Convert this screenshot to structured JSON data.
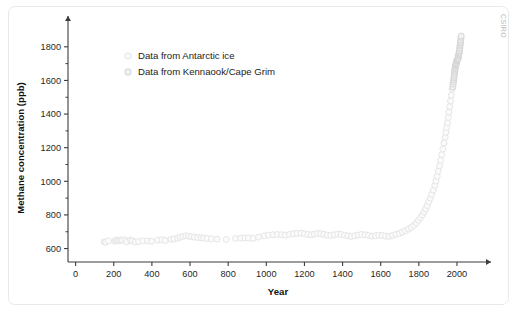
{
  "figure": {
    "credit": "CSIRO",
    "background_color": "#ffffff",
    "border_color": "#e9e9e9"
  },
  "legend": {
    "position": "upper-left-inside",
    "entries": [
      {
        "label": "Data from Antarctic ice",
        "marker": "open-circle-light",
        "color": "#fbfbfb",
        "edge_color": "#e2e2e2"
      },
      {
        "label": "Data from Kennaook/Cape Grim",
        "marker": "open-circle-gray",
        "color": "#f2f2f2",
        "edge_color": "#d2d2d2"
      }
    ]
  },
  "chart_data": {
    "type": "scatter",
    "title": "",
    "xlabel": "Year",
    "ylabel": "Methane concentration (ppb)",
    "xlim": [
      -40,
      2105
    ],
    "ylim": [
      520,
      1900
    ],
    "xticks": [
      0,
      200,
      400,
      600,
      800,
      1000,
      1200,
      1400,
      1600,
      1800,
      2000
    ],
    "yticks": [
      600,
      800,
      1000,
      1200,
      1400,
      1600,
      1800
    ],
    "xtick_labels": [
      "0",
      "200",
      "400",
      "600",
      "800",
      "1000",
      "1200",
      "1400",
      "1600",
      "1800",
      "2000"
    ],
    "ytick_labels": [
      "600",
      "800",
      "1000",
      "1200",
      "1400",
      "1600",
      "1800"
    ],
    "y_minor_ticks": [
      700,
      900,
      1100,
      1300,
      1500,
      1700
    ],
    "grid": false,
    "axis_style": "arrow-ended-open-axes",
    "series": [
      {
        "name": "Data from Antarctic ice",
        "marker_class": "pt-ice",
        "points": [
          [
            150,
            640
          ],
          [
            158,
            638
          ],
          [
            172,
            646
          ],
          [
            205,
            644
          ],
          [
            212,
            650
          ],
          [
            220,
            648
          ],
          [
            228,
            646
          ],
          [
            236,
            651
          ],
          [
            244,
            649
          ],
          [
            258,
            652
          ],
          [
            268,
            641
          ],
          [
            288,
            650
          ],
          [
            296,
            646
          ],
          [
            312,
            639
          ],
          [
            330,
            642
          ],
          [
            352,
            646
          ],
          [
            378,
            645
          ],
          [
            398,
            643
          ],
          [
            430,
            650
          ],
          [
            452,
            652
          ],
          [
            470,
            648
          ],
          [
            500,
            655
          ],
          [
            516,
            658
          ],
          [
            535,
            662
          ],
          [
            548,
            668
          ],
          [
            562,
            672
          ],
          [
            578,
            676
          ],
          [
            592,
            674
          ],
          [
            606,
            670
          ],
          [
            622,
            668
          ],
          [
            640,
            666
          ],
          [
            658,
            664
          ],
          [
            672,
            662
          ],
          [
            690,
            660
          ],
          [
            712,
            658
          ],
          [
            742,
            656
          ],
          [
            790,
            654
          ],
          [
            838,
            660
          ],
          [
            866,
            662
          ],
          [
            888,
            664
          ],
          [
            906,
            663
          ],
          [
            930,
            661
          ],
          [
            960,
            668
          ],
          [
            990,
            676
          ],
          [
            1012,
            680
          ],
          [
            1036,
            682
          ],
          [
            1058,
            684
          ],
          [
            1080,
            682
          ],
          [
            1100,
            680
          ],
          [
            1122,
            684
          ],
          [
            1142,
            688
          ],
          [
            1162,
            690
          ],
          [
            1182,
            692
          ],
          [
            1200,
            688
          ],
          [
            1218,
            684
          ],
          [
            1236,
            682
          ],
          [
            1252,
            686
          ],
          [
            1268,
            690
          ],
          [
            1286,
            688
          ],
          [
            1302,
            684
          ],
          [
            1320,
            680
          ],
          [
            1338,
            678
          ],
          [
            1356,
            682
          ],
          [
            1374,
            686
          ],
          [
            1392,
            684
          ],
          [
            1410,
            680
          ],
          [
            1428,
            676
          ],
          [
            1446,
            672
          ],
          [
            1464,
            676
          ],
          [
            1482,
            680
          ],
          [
            1500,
            684
          ],
          [
            1518,
            682
          ],
          [
            1536,
            678
          ],
          [
            1554,
            674
          ],
          [
            1572,
            676
          ],
          [
            1590,
            680
          ],
          [
            1608,
            678
          ],
          [
            1626,
            674
          ],
          [
            1644,
            672
          ],
          [
            1662,
            678
          ],
          [
            1680,
            684
          ],
          [
            1698,
            690
          ],
          [
            1714,
            698
          ],
          [
            1730,
            706
          ],
          [
            1746,
            716
          ],
          [
            1760,
            726
          ],
          [
            1774,
            738
          ],
          [
            1786,
            752
          ],
          [
            1798,
            768
          ],
          [
            1808,
            784
          ],
          [
            1818,
            800
          ],
          [
            1828,
            818
          ],
          [
            1836,
            836
          ],
          [
            1844,
            856
          ],
          [
            1852,
            878
          ],
          [
            1860,
            900
          ],
          [
            1868,
            922
          ],
          [
            1876,
            948
          ],
          [
            1884,
            976
          ],
          [
            1890,
            1002
          ],
          [
            1896,
            1030
          ],
          [
            1902,
            1060
          ],
          [
            1908,
            1092
          ],
          [
            1914,
            1124
          ],
          [
            1920,
            1158
          ],
          [
            1926,
            1192
          ],
          [
            1932,
            1228
          ],
          [
            1938,
            1262
          ],
          [
            1942,
            1292
          ],
          [
            1946,
            1320
          ],
          [
            1950,
            1348
          ],
          [
            1954,
            1380
          ],
          [
            1958,
            1412
          ],
          [
            1962,
            1444
          ],
          [
            1966,
            1478
          ],
          [
            1970,
            1512
          ],
          [
            1974,
            1548
          ],
          [
            1978,
            1582
          ]
        ]
      },
      {
        "name": "Data from Kennaook/Cape Grim",
        "marker_class": "pt-cg",
        "points": [
          [
            1978,
            1560
          ],
          [
            1980,
            1578
          ],
          [
            1982,
            1592
          ],
          [
            1983,
            1604
          ],
          [
            1984,
            1614
          ],
          [
            1985,
            1624
          ],
          [
            1986,
            1634
          ],
          [
            1987,
            1644
          ],
          [
            1988,
            1654
          ],
          [
            1989,
            1662
          ],
          [
            1990,
            1670
          ],
          [
            1991,
            1678
          ],
          [
            1992,
            1684
          ],
          [
            1993,
            1688
          ],
          [
            1994,
            1692
          ],
          [
            1995,
            1696
          ],
          [
            1996,
            1700
          ],
          [
            1997,
            1704
          ],
          [
            1998,
            1712
          ],
          [
            1999,
            1716
          ],
          [
            2000,
            1718
          ],
          [
            2001,
            1720
          ],
          [
            2002,
            1722
          ],
          [
            2003,
            1728
          ],
          [
            2004,
            1726
          ],
          [
            2005,
            1728
          ],
          [
            2006,
            1730
          ],
          [
            2007,
            1738
          ],
          [
            2008,
            1746
          ],
          [
            2009,
            1752
          ],
          [
            2010,
            1758
          ],
          [
            2011,
            1762
          ],
          [
            2012,
            1768
          ],
          [
            2013,
            1774
          ],
          [
            2014,
            1784
          ],
          [
            2015,
            1794
          ],
          [
            2016,
            1806
          ],
          [
            2017,
            1814
          ],
          [
            2018,
            1822
          ],
          [
            2019,
            1832
          ],
          [
            2020,
            1842
          ],
          [
            2021,
            1856
          ],
          [
            2022,
            1864
          ]
        ]
      }
    ]
  }
}
